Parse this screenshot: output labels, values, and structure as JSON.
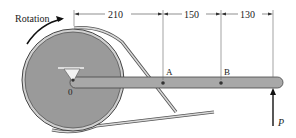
{
  "diagram": {
    "rotation_label": "Rotation",
    "pivot_label": "0",
    "point_a_label": "A",
    "point_b_label": "B",
    "force_label": "P",
    "dimensions": [
      "210",
      "150",
      "130"
    ],
    "colors": {
      "pulley": "#9a9a9a",
      "pulley_rim": "#c8c8c8",
      "arm": "#a8a8a8",
      "belt": "#bdbdbd",
      "line": "#333333"
    }
  }
}
